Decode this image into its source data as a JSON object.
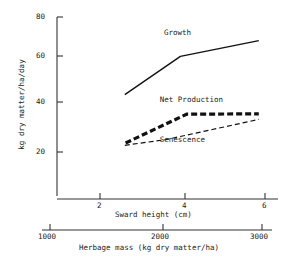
{
  "chart_data": {
    "type": "line",
    "title": "",
    "xlabel": "Sward height (cm)",
    "ylabel": "kg dry matter/ha/day",
    "secondary_xlabel": "Herbage mass (kg dry matter/ha)",
    "xlim": [
      1.2,
      6.3
    ],
    "ylim": [
      0,
      80
    ],
    "xticks": [
      2,
      4,
      6
    ],
    "xtick_labels": [
      "2",
      "4",
      "6"
    ],
    "yticks": [
      20,
      40,
      60,
      80
    ],
    "ytick_labels": [
      "20",
      "40",
      "60",
      "80"
    ],
    "secondary_xticks": [
      1000,
      2000,
      3000
    ],
    "secondary_xtick_labels": [
      "1000",
      "2000",
      "3000"
    ],
    "secondary_xlim": [
      820,
      3080
    ],
    "grid": false,
    "legend_position": "inline-annotations",
    "series": [
      {
        "name": "Growth",
        "style": "solid",
        "linewidth": 1.4,
        "color": "#111111",
        "x": [
          2.6,
          3.95,
          5.85
        ],
        "values": [
          45.5,
          62.5,
          69.5
        ],
        "label_x": 3.55,
        "label_y": 73.0
      },
      {
        "name": "Net Production",
        "style": "thick-dashed",
        "linewidth": 3.2,
        "color": "#111111",
        "x": [
          2.62,
          4.1,
          5.85
        ],
        "values": [
          24.0,
          36.8,
          37.0
        ],
        "label_x": 3.45,
        "label_y": 43.0
      },
      {
        "name": "Senescence",
        "style": "thin-dashed",
        "linewidth": 1.2,
        "color": "#111111",
        "x": [
          2.6,
          3.6,
          5.85
        ],
        "values": [
          23.0,
          25.5,
          34.5
        ],
        "label_x": 3.45,
        "label_y": 25.5
      }
    ]
  },
  "axes": {
    "y_axis_name": "kg dry matter/ha/day",
    "x_axis_name": "Sward height (cm)",
    "secondary_axis_name": "Herbage mass (kg dry matter/ha)"
  },
  "colors": {
    "ink": "#111111",
    "background": "#ffffff",
    "axis": "#333333"
  }
}
